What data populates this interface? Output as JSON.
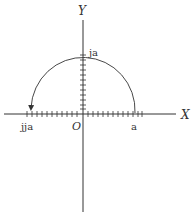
{
  "diagram": {
    "type": "complex-plane-rotation",
    "axes": {
      "x_label": "X",
      "y_label": "Y",
      "origin_label": "O"
    },
    "points": {
      "real": "a",
      "imag": "ja",
      "neg_real": "jja"
    },
    "arc": {
      "description": "Semicircle from a through ja to jja with arrowhead at jja",
      "from": "a",
      "via": "ja",
      "to": "jja"
    },
    "colors": {
      "stroke": "#333333",
      "background": "#ffffff"
    }
  }
}
